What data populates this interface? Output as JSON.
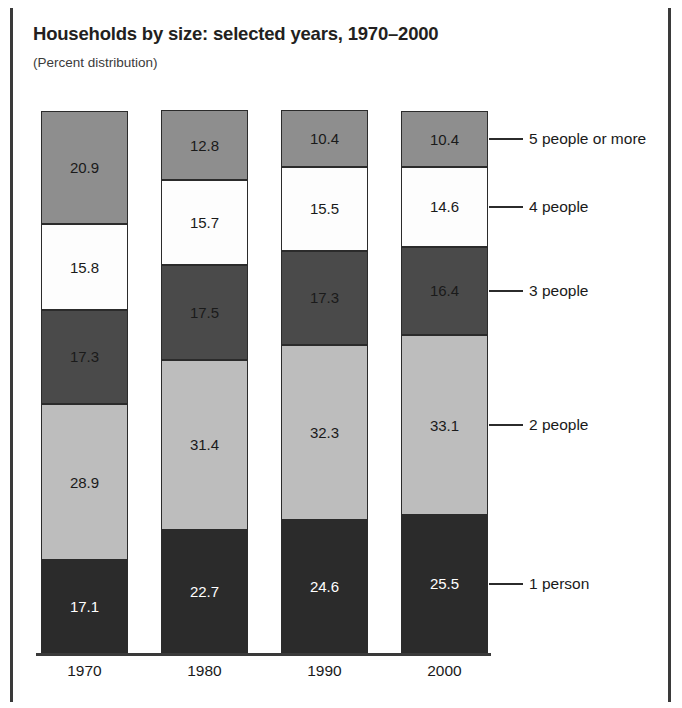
{
  "figure": {
    "title": "Households by size: selected years, 1970–2000",
    "subtitle": "(Percent distribution)"
  },
  "legend": {
    "items": [
      {
        "label": "5 people or more"
      },
      {
        "label": "4 people"
      },
      {
        "label": "3 people"
      },
      {
        "label": "2 people"
      },
      {
        "label": "1 person"
      }
    ]
  },
  "axis": {
    "ticks": [
      "1970",
      "1980",
      "1990",
      "2000"
    ]
  },
  "values": {
    "y1970": {
      "five_plus": "20.9",
      "four": "15.8",
      "three": "17.3",
      "two": "28.9",
      "one": "17.1"
    },
    "y1980": {
      "five_plus": "12.8",
      "four": "15.7",
      "three": "17.5",
      "two": "31.4",
      "one": "22.7"
    },
    "y1990": {
      "five_plus": "10.4",
      "four": "15.5",
      "three": "17.3",
      "two": "32.3",
      "one": "24.6"
    },
    "y2000": {
      "five_plus": "10.4",
      "four": "14.6",
      "three": "16.4",
      "two": "33.1",
      "one": "25.5"
    }
  },
  "colors": {
    "five_plus": "#8e8e8e",
    "four": "#fdfdfd",
    "three": "#4a4a4a",
    "two": "#bdbdbd",
    "one": "#2b2b2b",
    "outline": "#2b2b2b",
    "text_dark": "#1a1a1a",
    "text_light": "#ffffff",
    "frame": "#3a3a3a"
  },
  "chart_data": {
    "type": "bar",
    "title": "Households by size: selected years, 1970–2000",
    "subtitle": "(Percent distribution)",
    "xlabel": "",
    "ylabel": "Percent distribution",
    "ylim": [
      0,
      100
    ],
    "grid": false,
    "stacked": true,
    "stacked_order_bottom_to_top": [
      "1 person",
      "2 people",
      "3 people",
      "4 people",
      "5 people or more"
    ],
    "legend_position": "right-of-last-bar-with-leader-lines",
    "categories": [
      "1970",
      "1980",
      "1990",
      "2000"
    ],
    "series": [
      {
        "name": "1 person",
        "values": [
          17.1,
          22.7,
          24.6,
          25.5
        ],
        "color": "#2b2b2b"
      },
      {
        "name": "2 people",
        "values": [
          28.9,
          31.4,
          32.3,
          33.1
        ],
        "color": "#bdbdbd"
      },
      {
        "name": "3 people",
        "values": [
          17.3,
          17.5,
          17.3,
          16.4
        ],
        "color": "#4a4a4a"
      },
      {
        "name": "4 people",
        "values": [
          15.8,
          15.7,
          15.5,
          14.6
        ],
        "color": "#fdfdfd"
      },
      {
        "name": "5 people or more",
        "values": [
          20.9,
          12.8,
          10.4,
          10.4
        ],
        "color": "#8e8e8e"
      }
    ],
    "column_totals": [
      100.0,
      100.1,
      100.1,
      100.0
    ]
  }
}
